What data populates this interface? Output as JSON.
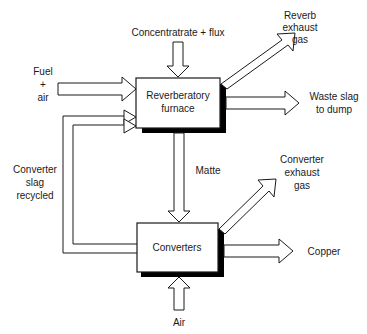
{
  "diagram": {
    "type": "process-flow",
    "colors": {
      "line": "#1a1a1a",
      "fill": "#ffffff",
      "shadow": "#000000"
    },
    "process_units": [
      {
        "id": "reverberatory-furnace",
        "label_line1": "Reverberatory",
        "label_line2": "furnace"
      },
      {
        "id": "converters",
        "label_line1": "Converters"
      }
    ],
    "streams": {
      "concentrate_flux": {
        "label": "Concentratrate + flux",
        "direction": "down",
        "target": "reverberatory-furnace"
      },
      "fuel_air": {
        "line1": "Fuel",
        "line2": "+",
        "line3": "air",
        "direction": "right",
        "target": "reverberatory-furnace"
      },
      "reverb_exhaust_gas": {
        "line1": "Reverb",
        "line2": "exhaust",
        "line3": "gas",
        "direction": "up-right",
        "source": "reverberatory-furnace"
      },
      "waste_slag": {
        "line1": "Waste slag",
        "line2": "to dump",
        "direction": "right",
        "source": "reverberatory-furnace"
      },
      "matte": {
        "label": "Matte",
        "direction": "down",
        "source": "reverberatory-furnace",
        "target": "converters"
      },
      "converter_slag_recycled": {
        "line1": "Converter",
        "line2": "slag",
        "line3": "recycled",
        "direction": "loop-left-up",
        "source": "converters",
        "target": "reverberatory-furnace"
      },
      "converter_exhaust_gas": {
        "line1": "Converter",
        "line2": "exhaust",
        "line3": "gas",
        "direction": "up-right",
        "source": "converters"
      },
      "copper": {
        "label": "Copper",
        "direction": "right",
        "source": "converters"
      },
      "air": {
        "label": "Air",
        "direction": "up",
        "target": "converters"
      }
    }
  }
}
